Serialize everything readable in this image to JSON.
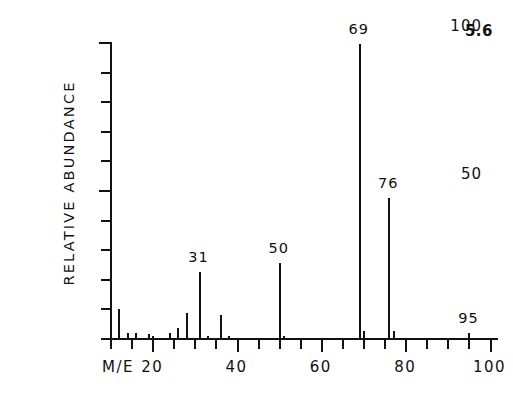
{
  "figure": {
    "number": "5.6"
  },
  "axes": {
    "y_title": "RELATIVE ABUNDANCE",
    "x_title": "M/E",
    "y_tick_labels": [
      {
        "value": 50,
        "text": "50"
      },
      {
        "value": 100,
        "text": "100"
      }
    ],
    "x_tick_labels": [
      {
        "value": 20,
        "text": "20"
      },
      {
        "value": 40,
        "text": "40"
      },
      {
        "value": 60,
        "text": "60"
      },
      {
        "value": 80,
        "text": "80"
      },
      {
        "value": 100,
        "text": "100"
      }
    ]
  },
  "chart_data": {
    "type": "bar",
    "title": "5.6",
    "xlabel": "M/E",
    "ylabel": "RELATIVE ABUNDANCE",
    "xlim": [
      10,
      102
    ],
    "ylim": [
      0,
      100
    ],
    "grid": false,
    "legend": null,
    "x_major_ticks": [
      20,
      40,
      60,
      80,
      100
    ],
    "x_minor_tick_step": 5,
    "y_major_ticks": [
      50,
      100
    ],
    "y_minor_tick_step": 10,
    "x": [
      12,
      14,
      16,
      19,
      20,
      24,
      26,
      28,
      31,
      33,
      36,
      38,
      50,
      51,
      69,
      70,
      76,
      77,
      95
    ],
    "values": [
      10.5,
      2.5,
      2.5,
      2.0,
      1.5,
      2.5,
      4.0,
      9.0,
      23.0,
      1.5,
      8.5,
      1.5,
      26.0,
      1.5,
      100.0,
      3.0,
      48.0,
      3.0,
      2.5
    ],
    "labeled_peaks": [
      {
        "mz": 31,
        "label": "31",
        "intensity": 23.0
      },
      {
        "mz": 50,
        "label": "50",
        "intensity": 26.0
      },
      {
        "mz": 69,
        "label": "69",
        "intensity": 100.0
      },
      {
        "mz": 76,
        "label": "76",
        "intensity": 48.0
      },
      {
        "mz": 95,
        "label": "95",
        "intensity": 2.5
      }
    ]
  },
  "colors": {
    "ink": "#111111",
    "background": "#ffffff"
  }
}
